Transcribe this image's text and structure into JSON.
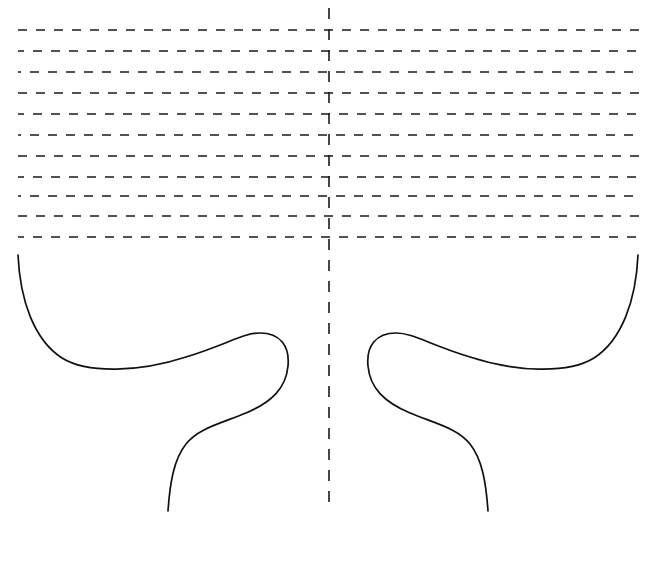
{
  "document": {
    "title": "Symmetric Dashed Pattern Diagram",
    "background_color": "#ffffff",
    "width": 656,
    "height": 575
  },
  "chart_data": {
    "type": "line",
    "subtitle": "",
    "xlabel": "",
    "ylabel": "",
    "grid": false,
    "legend": "none",
    "xlim": [
      0,
      656
    ],
    "ylim": [
      0,
      575
    ],
    "series": [
      {
        "name": "horizontal-dashed-rules",
        "kind": "dashed-horizontal-lines",
        "count": 11,
        "stroke": "#1a1a1a",
        "stroke_width": 1.6,
        "dash_pattern": "9 9",
        "x_start": 18,
        "x_end": 641,
        "y_values": [
          30,
          51,
          72,
          93,
          114,
          135,
          156,
          177,
          196,
          216,
          237
        ]
      },
      {
        "name": "vertical-fold-line",
        "kind": "dashed-vertical-line",
        "stroke": "#1a1a1a",
        "stroke_width": 1.6,
        "dash_pattern": "11 10",
        "x": 329,
        "y_start": 8,
        "y_end": 506
      },
      {
        "name": "left-contour-curve",
        "kind": "bezier-path",
        "stroke": "#111111",
        "stroke_width": 1.7,
        "path": "M 18 255 C 20 300 34 340 62 358 C 88 374 140 372 186 357 C 228 344 243 333 260 333 C 280 333 290 346 288 366 C 286 388 272 402 246 413 C 216 425 198 429 186 444 C 174 459 170 482 168 511"
      },
      {
        "name": "right-contour-curve",
        "kind": "bezier-path",
        "stroke": "#111111",
        "stroke_width": 1.7,
        "path": "M 638 255 C 636 300 622 340 594 358 C 568 374 516 372 470 357 C 428 344 413 333 396 333 C 376 333 366 346 368 366 C 370 388 384 402 410 413 C 440 425 458 429 470 444 C 482 459 486 482 488 511"
      }
    ]
  },
  "colors": {
    "stroke": "#1a1a1a",
    "curve_stroke": "#111111",
    "background": "#ffffff"
  }
}
